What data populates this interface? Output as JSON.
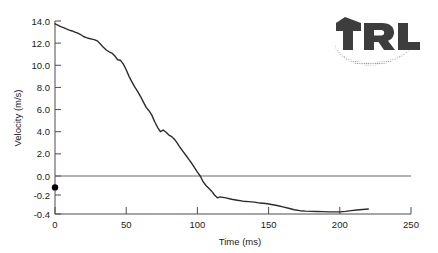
{
  "chart_data": {
    "type": "line",
    "title": "",
    "xlabel": "Time (ms)",
    "ylabel": "Velocity (m/s)",
    "xlim": [
      0,
      250
    ],
    "ylim": [
      -0.4,
      14.0
    ],
    "grid": false,
    "legend": null,
    "axis_note": "broken y-axis: 0.0 to 14.0 in 2.0 steps above zero, 0.0 to -0.4 in 0.2 steps below zero",
    "xticks": [
      0,
      50,
      100,
      150,
      200,
      250
    ],
    "xticklabels": [
      "0",
      "50",
      "100",
      "150",
      "200",
      "250"
    ],
    "yticks": [
      14.0,
      12.0,
      10.0,
      8.0,
      6.0,
      4.0,
      2.0,
      0.0,
      -0.2,
      -0.4
    ],
    "yticklabels": [
      "14.0",
      "12.0",
      "10.0",
      "8.0",
      "6.0",
      "4.0",
      "2.0",
      "0.0",
      "-0.2",
      "-0.4"
    ],
    "zero_reference_line": 0.0,
    "markers": [
      {
        "name": "origin-marker",
        "x": 0,
        "y": -0.12
      }
    ],
    "series": [
      {
        "name": "velocity",
        "color": "#2b2b2b",
        "x": [
          0,
          2,
          4,
          6,
          8,
          10,
          12,
          14,
          16,
          18,
          20,
          22,
          24,
          26,
          28,
          30,
          32,
          34,
          36,
          38,
          40,
          42,
          44,
          46,
          48,
          50,
          52,
          54,
          56,
          58,
          60,
          62,
          64,
          66,
          68,
          70,
          72,
          74,
          76,
          78,
          80,
          82,
          84,
          86,
          88,
          90,
          92,
          94,
          96,
          98,
          100,
          102,
          104,
          106,
          108,
          110,
          112,
          114,
          116,
          118,
          120,
          124,
          128,
          132,
          136,
          140,
          144,
          148,
          152,
          156,
          160,
          164,
          168,
          172,
          176,
          180,
          184,
          188,
          192,
          196,
          200,
          204,
          208,
          212,
          216,
          220
        ],
        "y": [
          13.75,
          13.62,
          13.5,
          13.4,
          13.28,
          13.18,
          13.1,
          13.0,
          12.9,
          12.78,
          12.6,
          12.5,
          12.42,
          12.36,
          12.3,
          12.18,
          11.9,
          11.62,
          11.38,
          11.22,
          11.1,
          10.85,
          10.5,
          10.45,
          10.1,
          9.6,
          9.0,
          8.5,
          8.05,
          7.65,
          7.2,
          6.7,
          6.2,
          5.9,
          5.5,
          4.9,
          4.4,
          4.0,
          4.15,
          3.95,
          3.7,
          3.55,
          3.3,
          2.95,
          2.55,
          2.2,
          1.85,
          1.5,
          1.15,
          0.75,
          0.35,
          0.0,
          -0.06,
          -0.1,
          -0.13,
          -0.16,
          -0.2,
          -0.23,
          -0.22,
          -0.225,
          -0.23,
          -0.245,
          -0.255,
          -0.265,
          -0.27,
          -0.275,
          -0.285,
          -0.29,
          -0.3,
          -0.31,
          -0.325,
          -0.34,
          -0.355,
          -0.365,
          -0.37,
          -0.372,
          -0.373,
          -0.375,
          -0.378,
          -0.378,
          -0.378,
          -0.372,
          -0.364,
          -0.358,
          -0.352,
          -0.348
        ]
      }
    ]
  },
  "logo": {
    "text": "TRL",
    "color": "#3d3d3d",
    "swoosh_color": "#8c8c8c"
  }
}
